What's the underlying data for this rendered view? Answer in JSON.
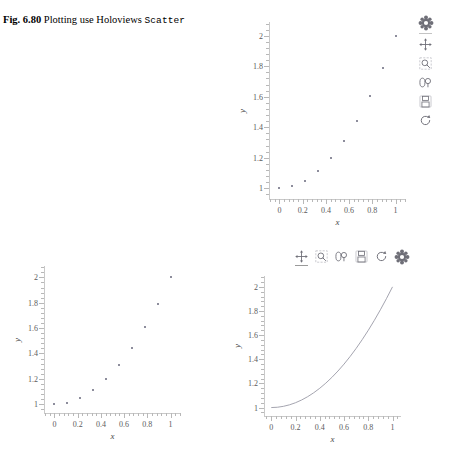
{
  "caption": {
    "fig_number": "Fig. 6.80",
    "text_part1": "Plotting use Holoviews ",
    "code_word": "Scatter"
  },
  "axes": {
    "x_title": "x",
    "y_title": "y",
    "x_ticklabels": [
      "0",
      "0.2",
      "0.4",
      "0.6",
      "0.8",
      "1"
    ],
    "y_ticklabels": [
      "1",
      "1.2",
      "1.4",
      "1.6",
      "1.8",
      "2"
    ]
  },
  "toolbar": {
    "tools": [
      {
        "name": "bokeh-logo-icon",
        "label": "Bokeh"
      },
      {
        "name": "pan-tool-icon",
        "label": "Pan"
      },
      {
        "name": "box-zoom-tool-icon",
        "label": "Box Zoom"
      },
      {
        "name": "wheel-zoom-tool-icon",
        "label": "Wheel Zoom"
      },
      {
        "name": "save-tool-icon",
        "label": "Save"
      },
      {
        "name": "reset-tool-icon",
        "label": "Reset"
      }
    ]
  },
  "chart_data": [
    {
      "id": "scatter-top",
      "type": "scatter",
      "title": "",
      "xlabel": "x",
      "ylabel": "y",
      "xlim": [
        -0.09,
        1.09
      ],
      "ylim": [
        0.93,
        2.09
      ],
      "xticks": [
        0,
        0.2,
        0.4,
        0.6,
        0.8,
        1
      ],
      "yticks": [
        1,
        1.2,
        1.4,
        1.6,
        1.8,
        2
      ],
      "grid": false,
      "legend": "none",
      "marker_color": "#8d8d9c",
      "x": [
        0.0,
        0.111,
        0.222,
        0.333,
        0.444,
        0.556,
        0.667,
        0.778,
        0.889,
        1.0
      ],
      "y": [
        1.0,
        1.012,
        1.049,
        1.111,
        1.198,
        1.309,
        1.444,
        1.605,
        1.79,
        2.0
      ]
    },
    {
      "id": "scatter-bottom-left",
      "type": "scatter",
      "title": "",
      "xlabel": "x",
      "ylabel": "y",
      "xlim": [
        -0.09,
        1.09
      ],
      "ylim": [
        0.93,
        2.09
      ],
      "xticks": [
        0,
        0.2,
        0.4,
        0.6,
        0.8,
        1
      ],
      "yticks": [
        1,
        1.2,
        1.4,
        1.6,
        1.8,
        2
      ],
      "grid": false,
      "legend": "none",
      "marker_color": "#8d8d9c",
      "x": [
        0.0,
        0.111,
        0.222,
        0.333,
        0.444,
        0.556,
        0.667,
        0.778,
        0.889,
        1.0
      ],
      "y": [
        1.0,
        1.012,
        1.049,
        1.111,
        1.198,
        1.309,
        1.444,
        1.605,
        1.79,
        2.0
      ]
    },
    {
      "id": "curve-bottom-right",
      "type": "line",
      "title": "",
      "xlabel": "x",
      "ylabel": "y",
      "xlim": [
        -0.06,
        1.07
      ],
      "ylim": [
        0.93,
        2.09
      ],
      "xticks": [
        0,
        0.2,
        0.4,
        0.6,
        0.8,
        1
      ],
      "yticks": [
        1,
        1.2,
        1.4,
        1.6,
        1.8,
        2
      ],
      "grid": false,
      "legend": "none",
      "line_color": "#9a9aa6",
      "x": [
        0.0,
        0.05,
        0.1,
        0.15,
        0.2,
        0.25,
        0.3,
        0.35,
        0.4,
        0.45,
        0.5,
        0.55,
        0.6,
        0.65,
        0.7,
        0.75,
        0.8,
        0.85,
        0.9,
        0.95,
        1.0
      ],
      "y": [
        1.0,
        1.0025,
        1.01,
        1.0225,
        1.04,
        1.0625,
        1.09,
        1.1225,
        1.16,
        1.2025,
        1.25,
        1.3025,
        1.36,
        1.4225,
        1.49,
        1.5625,
        1.64,
        1.7225,
        1.81,
        1.9025,
        2.0
      ]
    }
  ]
}
